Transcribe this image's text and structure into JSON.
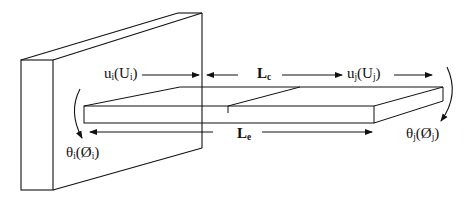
{
  "figure": {
    "wall": {
      "label": ""
    },
    "beam": {
      "segments": 2
    }
  },
  "labels": {
    "ui": {
      "main": "u",
      "sub": "i",
      "paren_main": "U",
      "paren_sub": "i"
    },
    "uj": {
      "main": "u",
      "sub": "j",
      "paren_main": "U",
      "paren_sub": "j"
    },
    "lc": {
      "main": "L",
      "sub": "c"
    },
    "le": {
      "main": "L",
      "sub": "e"
    },
    "theta_i": {
      "main": "θ",
      "sub": "i",
      "paren_main": "Ø",
      "paren_sub": "i"
    },
    "theta_j": {
      "main": "θ",
      "sub": "j",
      "paren_main": "Ø",
      "paren_sub": "j"
    }
  },
  "colors": {
    "stroke": "#111111",
    "background": "#ffffff"
  }
}
